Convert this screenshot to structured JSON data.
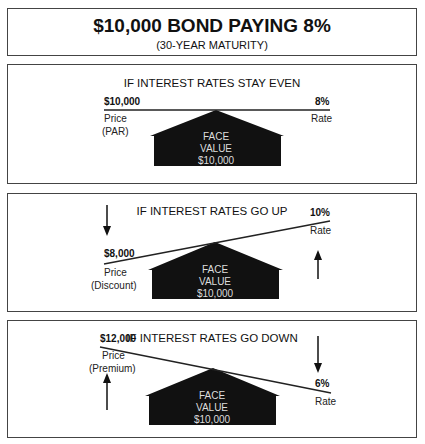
{
  "header": {
    "title": "$10,000 BOND PAYING 8%",
    "subtitle": "(30-YEAR MATURITY)"
  },
  "house": {
    "line1": "FACE",
    "line2": "VALUE",
    "line3": "$10,000"
  },
  "panels": [
    {
      "title": "IF INTEREST RATES STAY EVEN",
      "price_value": "$10,000",
      "price_label": "Price",
      "price_qualifier": "(PAR)",
      "rate_value": "8%",
      "rate_label": "Rate",
      "price_arrow": "none",
      "rate_arrow": "none"
    },
    {
      "title": "IF INTEREST RATES GO UP",
      "price_value": "$8,000",
      "price_label": "Price",
      "price_qualifier": "(Discount)",
      "rate_value": "10%",
      "rate_label": "Rate",
      "price_arrow": "down",
      "rate_arrow": "up"
    },
    {
      "title": "IF INTEREST RATES GO DOWN",
      "price_value": "$12,000",
      "price_label": "Price",
      "price_qualifier": "(Premium)",
      "rate_value": "6%",
      "rate_label": "Rate",
      "price_arrow": "up",
      "rate_arrow": "down"
    }
  ],
  "colors": {
    "house_fill": "#111111",
    "line": "#222222",
    "border": "#444444"
  }
}
